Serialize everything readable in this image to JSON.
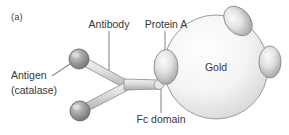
{
  "figure": {
    "panel_label": "(a)",
    "background_color": "#ffffff",
    "text_color": "#373737",
    "leader_color": "#8b8b8b",
    "gold_fill_light": "#fbfbfb",
    "gold_fill_dark": "#d2d2d2",
    "gold_stroke": "#9a9a9a",
    "protein_fill_light": "#f2f2f2",
    "protein_fill_dark": "#9e9e9e",
    "protein_stroke": "#8a8a8a",
    "antibody_fill_light": "#ededed",
    "antibody_fill_dark": "#b4b4b4",
    "antibody_stroke": "#8f8f8f",
    "antigen_fill_light": "#c9c9c9",
    "antigen_fill_dark": "#6f6f6f",
    "antigen_stroke": "#6a6a6a"
  },
  "labels": {
    "antibody": "Antibody",
    "protein_a": "Protein A",
    "antigen_line1": "Antigen",
    "antigen_line2": "(catalase)",
    "fc_domain": "Fc domain",
    "gold": "Gold"
  },
  "diagram": {
    "type": "schematic",
    "components": [
      {
        "name": "gold-nanoparticle",
        "shape": "circle",
        "cx": 216,
        "cy": 67,
        "r": 52,
        "label": "Gold"
      },
      {
        "name": "protein-a-left",
        "shape": "ellipse",
        "cx": 166,
        "cy": 67,
        "rx": 12,
        "ry": 17,
        "rotation": 0,
        "label": "Protein A"
      },
      {
        "name": "protein-a-top-right",
        "shape": "ellipse",
        "cx": 238,
        "cy": 21,
        "rx": 12,
        "ry": 16,
        "rotation": -42,
        "label": ""
      },
      {
        "name": "protein-a-right",
        "shape": "ellipse",
        "cx": 270,
        "cy": 62,
        "rx": 11,
        "ry": 16,
        "rotation": 0,
        "label": ""
      },
      {
        "name": "antibody-y",
        "shape": "y-arms",
        "label": "Antibody"
      },
      {
        "name": "antigen-upper",
        "shape": "sphere",
        "cx": 79,
        "cy": 59,
        "r": 10,
        "label": "Antigen (catalase)"
      },
      {
        "name": "antigen-lower",
        "shape": "sphere",
        "cx": 80,
        "cy": 111,
        "r": 10,
        "label": "Antigen (catalase)"
      },
      {
        "name": "fc-domain-tip",
        "shape": "rounded-tip",
        "cx": 160,
        "cy": 85,
        "label": "Fc domain"
      }
    ]
  }
}
